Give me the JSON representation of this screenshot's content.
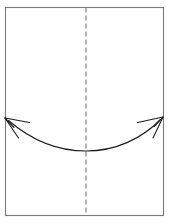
{
  "figure": {
    "name": "paper-fold-diagram",
    "type": "origami-fold-instruction",
    "background_color": "#ffffff",
    "width": 173,
    "height": 224
  },
  "paper": {
    "name": "paper-sheet",
    "shape": "rectangle",
    "x": 5.5,
    "y": 7.5,
    "width": 158,
    "height": 208,
    "stroke_color": "#7b7b7b",
    "stroke_width": 1.1,
    "fill_color": "#ffffff"
  },
  "fold_line": {
    "name": "vertical-center-fold-line",
    "orientation": "vertical",
    "x": 86,
    "y_start": 7.5,
    "y_end": 215.5,
    "stroke_color": "#6a6a6a",
    "stroke_width": 1,
    "dash_length": 5,
    "gap_length": 3,
    "dash_pattern": "5,3"
  },
  "motion_arrow": {
    "name": "double-headed-fold-arrow",
    "description": "curved arc sagging downward with arrowheads at both ends pointing outward and upward",
    "stroke_color": "#1c1c1c",
    "stroke_width": 1.1,
    "path": "M 9 121 Q 86 168 160 120",
    "left_tip": {
      "x": 5,
      "y": 118
    },
    "right_tip": {
      "x": 163,
      "y": 117
    },
    "low_point": {
      "x": 86,
      "y": 151
    },
    "arrowheads": [
      {
        "name": "left-arrowhead",
        "tip_x": 5,
        "tip_y": 118,
        "barbs": [
          {
            "name": "upper-barb",
            "to_x": 28,
            "to_y": 122
          },
          {
            "name": "lower-barb",
            "to_x": 18,
            "to_y": 137
          }
        ]
      },
      {
        "name": "right-arrowhead",
        "tip_x": 163,
        "tip_y": 117,
        "barbs": [
          {
            "name": "upper-barb",
            "to_x": 138,
            "to_y": 122
          },
          {
            "name": "lower-barb",
            "to_x": 153,
            "to_y": 137
          }
        ]
      }
    ]
  },
  "chart_data": {
    "type": "line",
    "title": "",
    "xlabel": "",
    "ylabel": "",
    "xlim": [
      0,
      173
    ],
    "ylim": [
      224,
      0
    ],
    "grid": false,
    "legend": "none",
    "series": [
      {
        "name": "fold-motion-arc",
        "x": [
          5,
          25,
          45,
          65,
          86,
          107,
          127,
          145,
          163
        ],
        "y": [
          118,
          131,
          141,
          148,
          151,
          148,
          141,
          130,
          117
        ]
      },
      {
        "name": "center-fold-line",
        "x": [
          86,
          86
        ],
        "y": [
          8,
          215
        ]
      }
    ]
  }
}
